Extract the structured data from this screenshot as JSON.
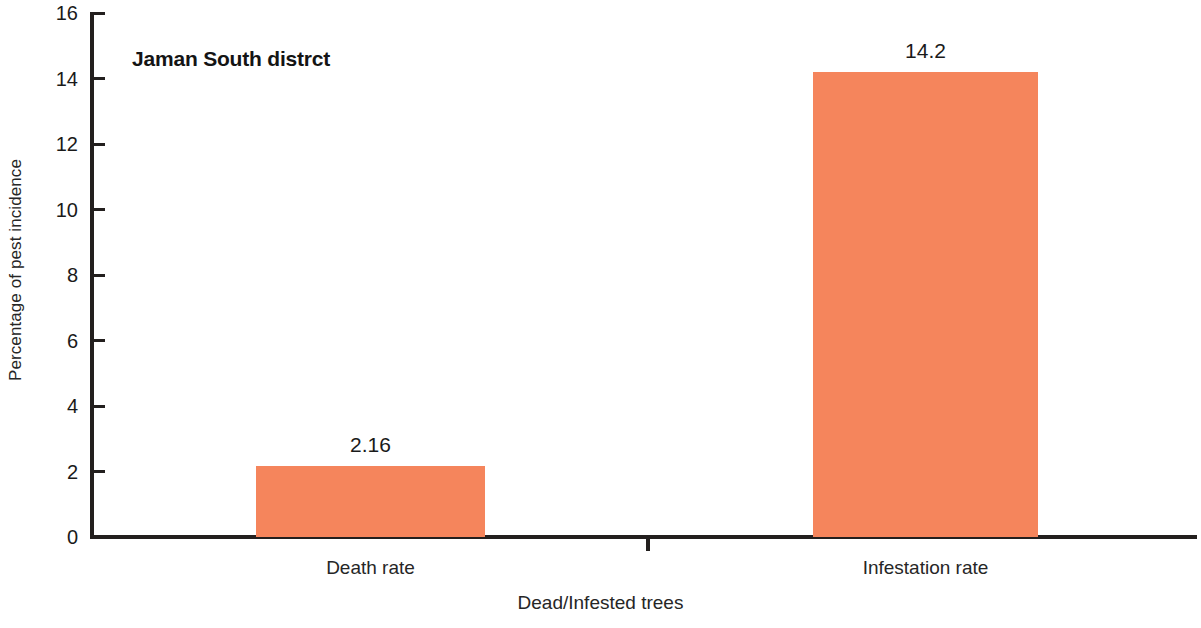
{
  "chart_data": {
    "type": "bar",
    "title": "Jaman South distrct",
    "xlabel": "Dead/Infested trees",
    "ylabel": "Percentage of pest incidence",
    "categories": [
      "Death rate",
      "Infestation rate"
    ],
    "values": [
      2.16,
      14.2
    ],
    "value_labels": [
      "2.16",
      "14.2"
    ],
    "ylim": [
      0,
      16
    ],
    "yticks": [
      0,
      2,
      4,
      6,
      8,
      10,
      12,
      14,
      16
    ],
    "ytick_labels": [
      "0",
      "2",
      "4",
      "6",
      "8",
      "10",
      "12",
      "14",
      "16"
    ],
    "grid": false,
    "legend": false,
    "bar_color": "#f5855c",
    "axis_color": "#231f1e",
    "background_color": "#ffffff"
  }
}
